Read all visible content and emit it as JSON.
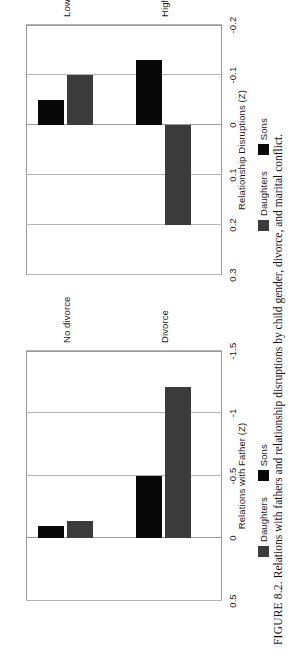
{
  "figure": {
    "label": "FIGURE 8.2.",
    "caption": "Relations with fathers and relationship disruptions by child gender, divorce, and marital conflict."
  },
  "legend": {
    "daughters_label": "Daughters",
    "sons_label": "Sons",
    "daughters_color": "#3b3b3b",
    "sons_color": "#080808"
  },
  "chart_data": [
    {
      "type": "bar",
      "panel": "left",
      "title": "",
      "xlabel": "",
      "ylabel": "Relations with Father (Z)",
      "categories": [
        "No divorce",
        "Divorce"
      ],
      "tick_labels": [
        "0.5",
        "0",
        "-0.5",
        "-1",
        "-1.5"
      ],
      "ticks": [
        0.5,
        0,
        -0.5,
        -1,
        -1.5
      ],
      "ylim": [
        -1.5,
        0.5
      ],
      "grid": true,
      "legend_position": "bottom",
      "series": [
        {
          "name": "Daughters",
          "color": "#3b3b3b",
          "values": [
            -0.14,
            -1.21
          ]
        },
        {
          "name": "Sons",
          "color": "#080808",
          "values": [
            -0.1,
            -0.5
          ]
        }
      ]
    },
    {
      "type": "bar",
      "panel": "right",
      "title": "",
      "xlabel": "",
      "ylabel": "Relationship Disruptions (Z)",
      "categories": [
        "Low Discord",
        "High Discord"
      ],
      "tick_labels": [
        "0.3",
        "0.2",
        "0.1",
        "0",
        "-0.1",
        "-0.2"
      ],
      "ticks": [
        0.3,
        0.2,
        0.1,
        0,
        -0.1,
        -0.2
      ],
      "ylim": [
        -0.2,
        0.3
      ],
      "grid": true,
      "legend_position": "bottom",
      "series": [
        {
          "name": "Daughters",
          "color": "#3b3b3b",
          "values": [
            -0.1,
            0.2
          ]
        },
        {
          "name": "Sons",
          "color": "#080808",
          "values": [
            -0.05,
            -0.13
          ]
        }
      ]
    }
  ]
}
